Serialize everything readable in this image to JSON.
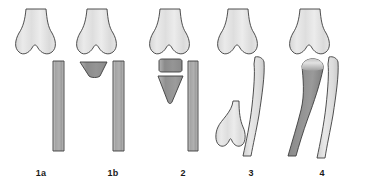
{
  "figure": {
    "background_color": "#ffffff",
    "width": 378,
    "height": 191
  },
  "palette": {
    "outline": "#3a3a3a",
    "bone_light": "#e3e3e3",
    "bone_light_2": "#dcdcdc",
    "shaft_gray": "#a8a8a8",
    "fragment_dark": "#8e8e8e",
    "fragment_mid": "#9a9a9a",
    "label_color": "#1a1a1a"
  },
  "panels": [
    {
      "id": "panel-1a",
      "label": "1a",
      "parts": [
        {
          "name": "distal-condyle",
          "shade": "bone_light"
        },
        {
          "name": "lateral-shaft",
          "shade": "shaft_gray"
        }
      ]
    },
    {
      "id": "panel-1b",
      "label": "1b",
      "parts": [
        {
          "name": "distal-condyle",
          "shade": "bone_light"
        },
        {
          "name": "wedge-fragment",
          "shade": "fragment_dark"
        },
        {
          "name": "lateral-shaft",
          "shade": "shaft_gray"
        }
      ]
    },
    {
      "id": "panel-2",
      "label": "2",
      "parts": [
        {
          "name": "distal-condyle",
          "shade": "bone_light"
        },
        {
          "name": "block-fragment",
          "shade": "fragment_dark"
        },
        {
          "name": "triangular-fragment",
          "shade": "fragment_mid"
        },
        {
          "name": "lateral-shaft",
          "shade": "shaft_gray"
        }
      ]
    },
    {
      "id": "panel-3",
      "label": "3",
      "parts": [
        {
          "name": "distal-condyle",
          "shade": "bone_light"
        },
        {
          "name": "curved-shaft",
          "shade": "bone_light_2"
        },
        {
          "name": "displaced-distal-fragment",
          "shade": "bone_light"
        }
      ]
    },
    {
      "id": "panel-4",
      "label": "4",
      "parts": [
        {
          "name": "distal-condyle",
          "shade": "bone_light"
        },
        {
          "name": "curved-shaft",
          "shade": "bone_light_2"
        },
        {
          "name": "angulated-fragment",
          "shade": "fragment_mid"
        }
      ]
    }
  ],
  "labels": {
    "p1a": "1a",
    "p1b": "1b",
    "p2": "2",
    "p3": "3",
    "p4": "4"
  }
}
